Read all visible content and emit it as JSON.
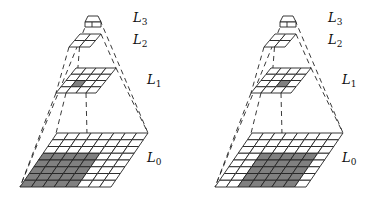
{
  "figure": {
    "levels": [
      {
        "name": "L3",
        "label_main": "L",
        "label_sub": "3",
        "grid": [
          1,
          1
        ]
      },
      {
        "name": "L2",
        "label_main": "L",
        "label_sub": "2",
        "grid": [
          2,
          2
        ]
      },
      {
        "name": "L1",
        "label_main": "L",
        "label_sub": "1",
        "grid": [
          4,
          4
        ]
      },
      {
        "name": "L0",
        "label_main": "L",
        "label_sub": "0",
        "grid": [
          8,
          8
        ]
      }
    ],
    "panels": [
      {
        "name": "left",
        "L1_shaded": {
          "col": 1,
          "row": 2
        },
        "L0_shaded": {
          "col_start": 0,
          "col_end": 4,
          "row_start": 3,
          "row_end": 7
        }
      },
      {
        "name": "right",
        "L1_shaded": {
          "col": 2,
          "row": 2
        },
        "L0_shaded": {
          "col_start": 2,
          "col_end": 6,
          "row_start": 3,
          "row_end": 7
        }
      }
    ],
    "colors": {
      "line": "#222222",
      "shade": "#808080",
      "fill": "#ffffff"
    }
  }
}
